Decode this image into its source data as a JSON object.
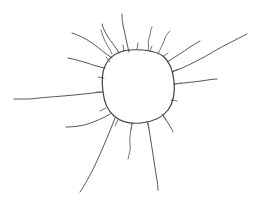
{
  "canvas": {
    "width": 261,
    "height": 200,
    "background_color": "#ffffff",
    "ink_color": "#4a4a52",
    "medium": "pencil-sketch",
    "subject": "sun"
  },
  "drawing": {
    "title": "Hand-drawn sun",
    "body": {
      "name": "sun-disc",
      "description": "irregular hand-drawn closed circle forming the sun's body",
      "center_x": 138,
      "center_y": 86,
      "radius_x": 35,
      "radius_y": 36,
      "path": "M 130 50 C 118 51 109 57 105 66 C 101 74 102 84 103 92 C 104 101 107 110 114 116 C 121 122 131 124 141 123 C 152 122 162 118 168 110 C 174 102 175 91 174 81 C 173 71 170 62 163 56 C 156 51 142 49 130 50 Z"
    },
    "rays": [
      {
        "name": "ray-top-center",
        "path": "M 129 52 C 127 44 125 34 123 25 C 122 20 122 17 122 14",
        "style": "stroke-ray",
        "length": 38,
        "direction": "up"
      },
      {
        "name": "ray-top-left-wavy",
        "path": "M 119 53 C 116 47 111 42 108 37 C 105 32 103 28 102 24",
        "style": "stroke-ray",
        "length": 30,
        "direction": "up-left"
      },
      {
        "name": "ray-upper-left-long",
        "path": "M 112 58 C 106 54 99 48 92 43 C 85 38 78 35 72 33",
        "style": "stroke-ray",
        "length": 45,
        "direction": "up-left"
      },
      {
        "name": "ray-left-upper-bent",
        "path": "M 105 68 C 99 67 93 65 87 63 C 80 61 74 59 68 58",
        "style": "stroke-ray",
        "length": 38,
        "direction": "left-up"
      },
      {
        "name": "ray-left-horizontal-long",
        "path": "M 103 92 C 91 93 77 95 63 96 C 50 97 38 98 30 99 C 24 99 18 99 14 99",
        "style": "stroke-ray",
        "length": 90,
        "direction": "left"
      },
      {
        "name": "ray-lower-left-short",
        "path": "M 110 114 C 104 118 96 121 88 124 C 81 126 73 127 66 127",
        "style": "stroke-ray",
        "length": 46,
        "direction": "down-left"
      },
      {
        "name": "ray-bottom-left-long",
        "path": "M 115 118 C 110 131 103 148 96 163 C 90 176 84 186 80 192",
        "style": "stroke-ray",
        "length": 78,
        "direction": "down-left"
      },
      {
        "name": "ray-bottom-center-wavy",
        "path": "M 132 123 C 131 131 129 138 130 144 C 131 150 129 154 128 159",
        "style": "stroke-ray-faint",
        "length": 37,
        "direction": "down"
      },
      {
        "name": "ray-bottom-right-long",
        "path": "M 148 123 C 150 136 153 153 155 168 C 157 180 158 186 158 190",
        "style": "stroke-ray",
        "length": 68,
        "direction": "down"
      },
      {
        "name": "ray-lower-right-short",
        "path": "M 163 116 C 166 120 169 124 171 128 C 172 130 173 131 173 132",
        "style": "stroke-ray",
        "length": 20,
        "direction": "down-right"
      },
      {
        "name": "ray-right-horizontal",
        "path": "M 174 84 C 184 83 193 82 201 81 C 208 80 213 79 217 79",
        "style": "stroke-ray",
        "length": 44,
        "direction": "right"
      },
      {
        "name": "ray-upper-right-longest",
        "path": "M 172 72 C 186 67 203 58 218 49 C 231 42 241 37 247 34",
        "style": "stroke-ray",
        "length": 86,
        "direction": "up-right"
      },
      {
        "name": "ray-upper-right-mid",
        "path": "M 167 62 C 175 57 183 52 190 47 C 195 44 198 42 200 41",
        "style": "stroke-ray",
        "length": 40,
        "direction": "up-right"
      },
      {
        "name": "ray-upper-right-squiggle",
        "path": "M 158 54 C 160 49 163 45 164 41 C 165 37 167 34 170 31",
        "style": "stroke-ray-faint",
        "length": 25,
        "direction": "up-right"
      },
      {
        "name": "ray-top-right-curl",
        "path": "M 148 50 C 150 46 147 42 149 38 C 151 34 150 30 152 27",
        "style": "stroke-ray-faint",
        "length": 24,
        "direction": "up"
      },
      {
        "name": "ray-top-left-curl",
        "path": "M 112 54 C 110 49 107 45 105 41 C 103 37 102 33 101 30",
        "style": "stroke-ray-faint",
        "length": 25,
        "direction": "up-left"
      }
    ],
    "rim_ticks": [
      {
        "name": "rim-tick-top-1",
        "path": "M 124 51 L 123 45"
      },
      {
        "name": "rim-tick-top-2",
        "path": "M 137 49 L 138 43"
      },
      {
        "name": "rim-tick-top-3",
        "path": "M 150 51 L 152 46"
      },
      {
        "name": "rim-tick-upper-right",
        "path": "M 163 57 L 168 53"
      },
      {
        "name": "rim-tick-right-1",
        "path": "M 173 71 L 179 69"
      },
      {
        "name": "rim-tick-right-2",
        "path": "M 175 84 L 181 83"
      },
      {
        "name": "rim-tick-right-3",
        "path": "M 171 100 L 177 101"
      },
      {
        "name": "rim-tick-lower-right",
        "path": "M 162 114 L 166 119"
      },
      {
        "name": "rim-tick-bottom-1",
        "path": "M 147 122 L 149 128"
      },
      {
        "name": "rim-tick-bottom-2",
        "path": "M 132 124 L 131 130"
      },
      {
        "name": "rim-tick-bottom-3",
        "path": "M 118 120 L 115 126"
      },
      {
        "name": "rim-tick-lower-left",
        "path": "M 106 108 L 100 111"
      },
      {
        "name": "rim-tick-left-1",
        "path": "M 102 92 L 96 92"
      },
      {
        "name": "rim-tick-left-2",
        "path": "M 104 78 L 98 77"
      },
      {
        "name": "rim-tick-upper-left",
        "path": "M 110 62 L 106 57"
      }
    ]
  }
}
